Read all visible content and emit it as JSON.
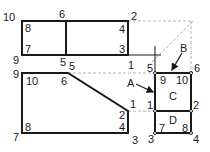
{
  "diagram": {
    "title": "",
    "shapes": {
      "top_rectangle": {
        "outer_labels": {
          "top_left": "10",
          "top_mid": "6",
          "top_right": "2",
          "bottom_left": "9",
          "bottom_mid": "5"
        },
        "inner_labels": {
          "left_top": "8",
          "left_bottom": "7",
          "right_top": "4",
          "right_bottom": "3"
        }
      },
      "trapezoid": {
        "outer_labels": {
          "top_left": "9",
          "top_mid_a": "5",
          "top_mid_b": "5",
          "bottom_left": "7",
          "right_top": "1",
          "right_bottom": "3"
        },
        "inner_labels": {
          "top_left": "10",
          "top_right": "6",
          "right_top": "2",
          "right_bottom": "4",
          "bottom_left": "8"
        }
      },
      "box_c": {
        "name": "C",
        "corner_labels": {
          "top_left_outer": "5",
          "top_right_outer": "6",
          "mid_left_outer": "1",
          "mid_right_outer": "2"
        },
        "inner_labels": {
          "top_left": "9",
          "top_right": "10"
        }
      },
      "box_d": {
        "name": "D",
        "corner_labels": {
          "bottom_left_outer": "3",
          "bottom_right_outer": "4"
        },
        "inner_labels": {
          "bottom_left": "7",
          "bottom_right": "8"
        }
      }
    },
    "extension_labels": {
      "mid_one": "1",
      "mid_five": "5"
    },
    "callouts": {
      "a": "A",
      "b": "B"
    },
    "stroke_color": "#1a1a1a",
    "dashed_color": "#b0b0b0"
  }
}
